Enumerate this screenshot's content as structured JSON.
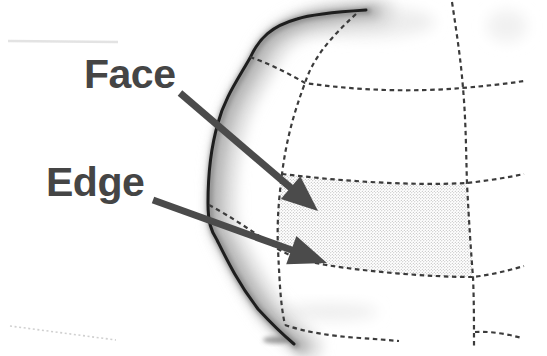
{
  "labels": {
    "face": "Face",
    "edge": "Edge"
  },
  "colors": {
    "background": "#ffffff",
    "label_text": "#454545",
    "arrow": "#4b4b4b",
    "mesh_line": "#3b3b3b",
    "silhouette": "#1e1e1e",
    "stipple_dot": "#a8a8a8"
  }
}
